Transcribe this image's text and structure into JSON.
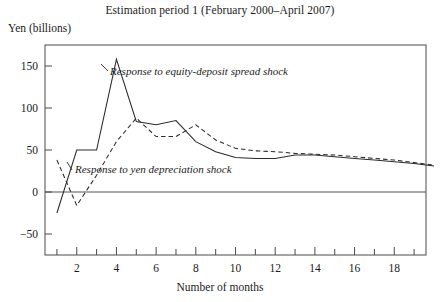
{
  "chart_data": {
    "type": "line",
    "title": "Estimation period 1 (February 2000–April 2007)",
    "xlabel": "Number of months",
    "ylabel": "Yen (billions)",
    "xlim": [
      0.4,
      19.6
    ],
    "ylim": [
      -75,
      175
    ],
    "grid": false,
    "legend_position": "inline-annotations",
    "xticks_major": [
      2,
      4,
      6,
      8,
      10,
      12,
      14,
      16,
      18
    ],
    "xtick_labels": [
      "2",
      "4",
      "6",
      "8",
      "10",
      "12",
      "14",
      "16",
      "18"
    ],
    "xticks_minor": [
      1,
      3,
      5,
      7,
      9,
      11,
      13,
      15,
      17,
      19
    ],
    "yticks": [
      -50,
      0,
      50,
      100,
      150
    ],
    "ytick_labels": [
      "−50",
      "0",
      "50",
      "100",
      "150"
    ],
    "x": [
      1,
      2,
      3,
      4,
      5,
      6,
      7,
      8,
      9,
      10,
      11,
      12,
      13,
      14,
      15,
      16,
      17,
      18,
      19,
      20
    ],
    "series": [
      {
        "name": "Response to equity-deposit spread shock",
        "style": "solid",
        "annotation": "Response to equity-deposit spread shock",
        "values": [
          -25,
          50,
          50,
          158,
          84,
          80,
          85,
          60,
          48,
          41,
          40,
          40,
          44,
          44,
          42,
          40,
          38,
          36,
          34,
          31
        ]
      },
      {
        "name": "Response to yen depreciation shock",
        "style": "dashed",
        "annotation": "Response to yen depreciation shock",
        "values": [
          38,
          -16,
          20,
          60,
          88,
          66,
          66,
          80,
          62,
          52,
          49,
          48,
          46,
          45,
          44,
          42,
          40,
          38,
          35,
          32
        ]
      }
    ]
  },
  "annotations": {
    "series_1_label": "Response to equity-deposit spread shock",
    "series_2_label": "Response to yen depreciation shock"
  },
  "axes": {
    "title": "Estimation period 1 (February 2000–April 2007)",
    "ylabel": "Yen (billions)",
    "xlabel": "Number of months"
  },
  "colors": {
    "line": "#2b2b2b",
    "frame": "#4a4a4a",
    "background": "#ffffff"
  }
}
